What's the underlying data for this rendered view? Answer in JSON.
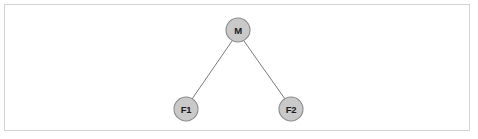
{
  "figure": {
    "kind": "tree-diagram",
    "background_color": "#ffffff",
    "border_color": "#d2d2d2",
    "width": 478,
    "height": 139
  },
  "diagram": {
    "node_fill_color": "#c9c9c9",
    "node_stroke_color": "#8c8c8c",
    "edge_color": "#7a7a7a",
    "label_color": "#1a1a1a",
    "node_radius": 12,
    "nodes": [
      {
        "id": "M",
        "label": "M",
        "cx": 238,
        "cy": 30,
        "role": "root"
      },
      {
        "id": "F1",
        "label": "F1",
        "cx": 186,
        "cy": 109,
        "role": "leaf"
      },
      {
        "id": "F2",
        "label": "F2",
        "cx": 291,
        "cy": 109,
        "role": "leaf"
      }
    ],
    "edges": [
      {
        "from": "M",
        "to": "F1",
        "x1": 232,
        "y1": 41,
        "x2": 192,
        "y2": 99
      },
      {
        "from": "M",
        "to": "F2",
        "x1": 244,
        "y1": 41,
        "x2": 285,
        "y2": 99
      }
    ]
  }
}
